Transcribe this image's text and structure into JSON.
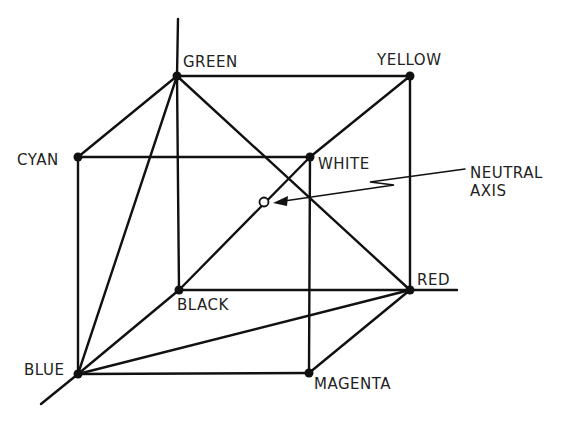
{
  "diagram": {
    "vertices": {
      "green": {
        "label": "GREEN",
        "x": 177,
        "y": 76
      },
      "yellow": {
        "label": "YELLOW",
        "x": 410,
        "y": 76
      },
      "cyan": {
        "label": "CYAN",
        "x": 78,
        "y": 157
      },
      "white": {
        "label": "WHITE",
        "x": 310,
        "y": 157
      },
      "black": {
        "label": "BLACK",
        "x": 179,
        "y": 290
      },
      "red": {
        "label": "RED",
        "x": 410,
        "y": 290
      },
      "blue": {
        "label": "BLUE",
        "x": 78,
        "y": 374
      },
      "magenta": {
        "label": "MAGENTA",
        "x": 309,
        "y": 373
      }
    },
    "annotation": {
      "line1": "NEUTRAL",
      "line2": "AXIS"
    },
    "colors": {
      "stroke": "#111111",
      "background": "#ffffff"
    }
  }
}
